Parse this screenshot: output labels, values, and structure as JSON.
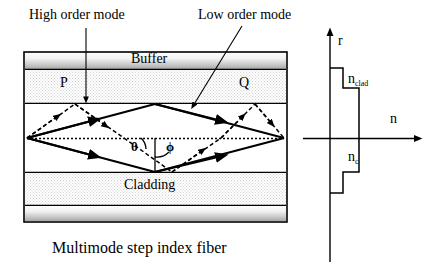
{
  "figure": {
    "caption": "Multimode step index fiber",
    "type": "optical-fiber-ray-diagram"
  },
  "annotations": {
    "high_order_mode": "High order mode",
    "low_order_mode": "Low order mode",
    "point_p": "P",
    "point_q": "Q",
    "angle_theta": "θ",
    "angle_phi": "ϕ"
  },
  "fiber_layers": [
    {
      "name": "Buffer",
      "label": "Buffer",
      "fill": "gradient-gray",
      "top": 53,
      "height": 16
    },
    {
      "name": "Cladding (upper)",
      "label": "",
      "fill": "stipple",
      "top": 71,
      "height": 31
    },
    {
      "name": "Core",
      "label": "",
      "fill": "white",
      "top": 104,
      "height": 68
    },
    {
      "name": "Cladding (lower)",
      "label": "Cladding",
      "fill": "stipple",
      "top": 174,
      "height": 31
    },
    {
      "name": "Buffer (lower)",
      "label": "",
      "fill": "gradient-gray",
      "top": 207,
      "height": 14
    }
  ],
  "index_profile": {
    "type": "step",
    "axis_vertical_label": "r",
    "axis_horizontal_label": "n",
    "cladding_index_label": "n",
    "cladding_index_sub": "clad",
    "core_index_label": "n",
    "core_index_sub": "c",
    "description": "Step refractive index profile: high n in core, lower n in cladding, lowest in buffer"
  },
  "colors": {
    "line": "#000000",
    "background": "#ffffff",
    "stipple": "#efefef",
    "buffer_light": "#fbfbfb",
    "buffer_dark": "#b4b4b4"
  }
}
